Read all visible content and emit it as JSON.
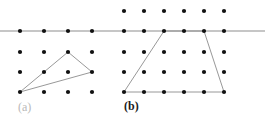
{
  "figure": {
    "width": 265,
    "height": 122,
    "background_color": "#ffffff"
  },
  "style": {
    "dot_color": "#111111",
    "dot_radius": 2.1,
    "polygon_stroke_color": "#8c8c8c",
    "polygon_stroke_width": 0.9,
    "polygon_fill": "none",
    "axis_line_color": "#b3b3b3",
    "axis_line_width": 1.6,
    "caption_a_color": "#b9b9b9",
    "caption_b_color": "#1a1a1a"
  },
  "axis_line": {
    "label": "horizontal-separator-line",
    "x1": 0,
    "y1": 31,
    "x2": 265,
    "y2": 31
  },
  "panels": [
    {
      "id": "panel-a",
      "caption": "(a)",
      "caption_position": {
        "x": 18,
        "y": 101
      },
      "grid": {
        "columns": 4,
        "rows": 4,
        "x_positions": [
          20,
          44,
          68,
          92
        ],
        "y_positions": [
          31,
          52,
          72,
          92
        ],
        "x_spacing": 24,
        "y_spacing": 20.3
      },
      "shape": {
        "name": "triangle",
        "vertices": [
          {
            "col": 3,
            "row": 2,
            "x": 68,
            "y": 52
          },
          {
            "col": 4,
            "row": 3,
            "x": 92,
            "y": 72
          },
          {
            "col": 1,
            "row": 4,
            "x": 20,
            "y": 92
          }
        ],
        "closed": true
      }
    },
    {
      "id": "panel-b",
      "caption": "(b)",
      "caption_position": {
        "x": 124,
        "y": 100
      },
      "grid": {
        "columns": 6,
        "rows": 5,
        "x_positions": [
          124,
          144,
          164,
          184,
          204,
          224
        ],
        "y_positions": [
          11,
          31,
          52,
          72,
          92
        ],
        "x_spacing": 20,
        "y_spacing": 20.3
      },
      "shape": {
        "name": "trapezoid",
        "vertices": [
          {
            "col": 3,
            "row": 2,
            "x": 164,
            "y": 31
          },
          {
            "col": 5,
            "row": 2,
            "x": 204,
            "y": 31
          },
          {
            "col": 6,
            "row": 5,
            "x": 224,
            "y": 92
          },
          {
            "col": 1,
            "row": 5,
            "x": 124,
            "y": 92
          }
        ],
        "closed": true
      }
    }
  ]
}
